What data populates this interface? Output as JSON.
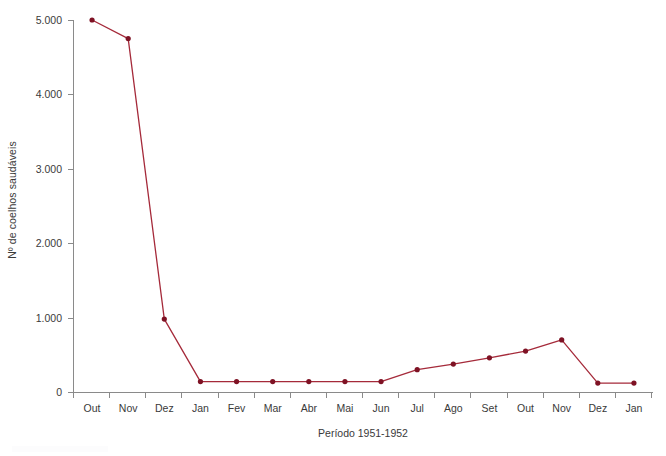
{
  "chart_data": {
    "type": "line",
    "title": "",
    "subtitle": "",
    "xlabel": "Período 1951-1952",
    "ylabel": "Nº de coelhos saudáveis",
    "categories": [
      "Out",
      "Nov",
      "Dez",
      "Jan",
      "Fev",
      "Mar",
      "Abr",
      "Mai",
      "Jun",
      "Jul",
      "Ago",
      "Set",
      "Out",
      "Nov",
      "Dez",
      "Jan"
    ],
    "values": [
      5000,
      4750,
      980,
      140,
      140,
      140,
      140,
      140,
      140,
      300,
      375,
      460,
      550,
      700,
      120,
      120
    ],
    "series": [
      {
        "name": "Nº de coelhos saudáveis",
        "values": [
          5000,
          4750,
          980,
          140,
          140,
          140,
          140,
          140,
          140,
          300,
          375,
          460,
          550,
          700,
          120,
          120
        ]
      }
    ],
    "ylim": [
      0,
      5000
    ],
    "ytick_values": [
      0,
      1000,
      2000,
      3000,
      4000,
      5000
    ],
    "ytick_labels": [
      "0",
      "1.000",
      "2.000",
      "3.000",
      "4.000",
      "5.000"
    ],
    "grid": false,
    "legend": false,
    "legend_position": "none",
    "line_color": "#a52a3a",
    "marker_color": "#7e1224",
    "axis_color": "#8a8a8a",
    "background_color": "#ffffff",
    "marker": "circle"
  },
  "axes": {
    "y_title": "Nº de coelhos saudáveis",
    "x_title": "Período 1951-1952"
  }
}
